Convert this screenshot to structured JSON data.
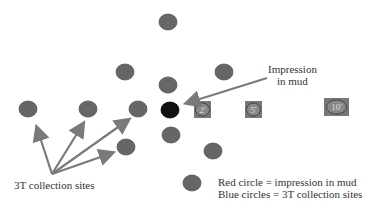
{
  "colors": {
    "site_circle": "#666666",
    "impression_circle": "#111111",
    "arrow": "#7a7a7a",
    "distance_marker": "#777777",
    "text": "#333333"
  },
  "annotations": {
    "impression_label_line1": "Impression",
    "impression_label_line2": "in mud",
    "sites_label": "3T collection sites"
  },
  "distance_markers": [
    {
      "label": "2'"
    },
    {
      "label": "5'"
    },
    {
      "label": "10'"
    }
  ],
  "legend": {
    "line1": "Red circle = impression in mud",
    "line2": "Blue circles = 3T collection sites"
  }
}
